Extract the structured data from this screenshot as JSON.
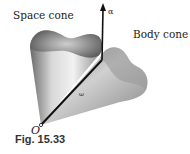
{
  "figure": {
    "caption": "Fig. 15.33",
    "labels": {
      "space_cone": "Space cone",
      "body_cone": "Body cone",
      "vector_axis": "α",
      "vector_omega": "ω",
      "origin": "O"
    }
  }
}
